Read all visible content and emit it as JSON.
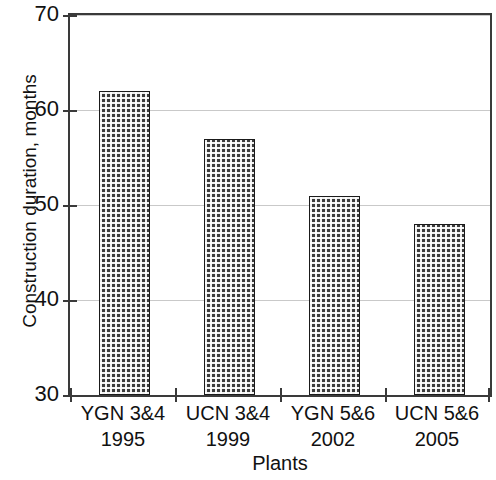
{
  "chart_data": {
    "type": "bar",
    "title": "",
    "xlabel": "Plants",
    "ylabel": "Construction duration, months",
    "categories": [
      "YGN 3&4",
      "UCN 3&4",
      "YGN 5&6",
      "UCN 5&6"
    ],
    "category_sublabels": [
      "1995",
      "1999",
      "2002",
      "2005"
    ],
    "values": [
      62,
      57,
      51,
      48
    ],
    "ylim": [
      30,
      70
    ],
    "yticks": [
      30,
      40,
      50,
      60,
      70
    ],
    "ytick_labels": [
      "30",
      "40",
      "50",
      "60",
      "70"
    ],
    "grid": true,
    "legend": "none",
    "series": [
      {
        "name": "Construction duration",
        "values": [
          62,
          57,
          51,
          48
        ]
      }
    ],
    "bar_fill": "#3b3b3b",
    "bar_edge": "#1a1a1a",
    "grid_color": "#c9c9c9",
    "axis_color": "#3a3a3a"
  }
}
